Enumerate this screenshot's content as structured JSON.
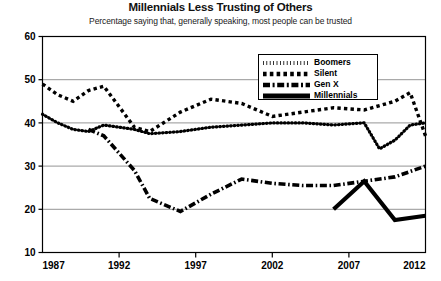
{
  "chart_data": {
    "type": "line",
    "title": "Millennials Less Trusting of Others",
    "subtitle": "Percentage saying that, generally speaking, most people can be trusted",
    "xlabel": "",
    "ylabel": "",
    "xlim": [
      1987,
      2012
    ],
    "ylim": [
      10,
      60
    ],
    "yticks": [
      10,
      20,
      30,
      40,
      50,
      60
    ],
    "xticks": [
      1987,
      1992,
      1997,
      2002,
      2007,
      2012
    ],
    "grid": "horizontal",
    "legend_position": "top-right",
    "series": [
      {
        "name": "Boomers",
        "style": "dotted",
        "color": "#000000",
        "x": [
          1987,
          1988,
          1989,
          1990,
          1991,
          1993,
          1994,
          1996,
          1998,
          2000,
          2002,
          2004,
          2006,
          2008,
          2009,
          2010,
          2011,
          2012
        ],
        "values": [
          42,
          40,
          38.5,
          38,
          39.5,
          38.5,
          37.5,
          38,
          39,
          39.5,
          40,
          40,
          39.5,
          40,
          34,
          36,
          39.5,
          40
        ]
      },
      {
        "name": "Silent",
        "style": "dashed",
        "color": "#000000",
        "x": [
          1987,
          1988,
          1989,
          1990,
          1991,
          1993,
          1994,
          1996,
          1998,
          2000,
          2002,
          2004,
          2006,
          2008,
          2010,
          2011,
          2012
        ],
        "values": [
          49,
          46.5,
          45,
          47.5,
          48.5,
          39,
          38,
          42.5,
          45.5,
          44.5,
          41.5,
          42.5,
          43.5,
          43,
          45,
          47,
          37
        ]
      },
      {
        "name": "Gen X",
        "style": "dash-dot",
        "color": "#000000",
        "x": [
          1990,
          1991,
          1993,
          1994,
          1996,
          1998,
          2000,
          2002,
          2004,
          2006,
          2008,
          2010,
          2012
        ],
        "values": [
          38.5,
          37,
          29,
          22.5,
          19.5,
          23.5,
          27,
          26,
          25.5,
          25.5,
          26.5,
          27.5,
          30
        ]
      },
      {
        "name": "Millennials",
        "style": "solid",
        "color": "#000000",
        "x": [
          2006,
          2008,
          2010,
          2012
        ],
        "values": [
          20,
          26.5,
          17.5,
          18.5
        ]
      }
    ]
  },
  "axis": {
    "ytick_labels": [
      "60",
      "50",
      "40",
      "30",
      "20",
      "10"
    ],
    "xtick_labels": [
      "1987",
      "1992",
      "1997",
      "2002",
      "2007",
      "2012"
    ]
  },
  "legend": {
    "items": [
      {
        "label": "Boomers",
        "style": "dotted"
      },
      {
        "label": "Silent",
        "style": "dashed"
      },
      {
        "label": "Gen X",
        "style": "dash-dot"
      },
      {
        "label": "Millennials",
        "style": "solid"
      }
    ]
  }
}
